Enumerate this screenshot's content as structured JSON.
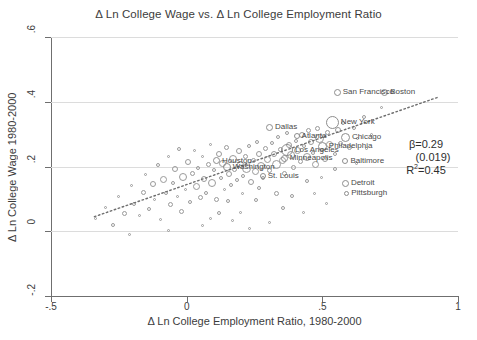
{
  "chart_data": {
    "type": "scatter",
    "title": "Δ Ln College Wage vs. Δ Ln College Employment Ratio",
    "xlabel": "Δ Ln College Employment Ratio, 1980-2000",
    "ylabel": "Δ Ln College Wage 1980-2000",
    "xlim": [
      -0.5,
      1.0
    ],
    "ylim": [
      -0.2,
      0.6
    ],
    "xticks": [
      "-.5",
      "0",
      ".5",
      "1"
    ],
    "xtick_values": [
      -0.5,
      0,
      0.5,
      1
    ],
    "yticks": [
      "-.2",
      "0",
      ".2",
      ".4",
      ".6"
    ],
    "ytick_values": [
      -0.2,
      0,
      0.2,
      0.4,
      0.6
    ],
    "grid": "horizontal",
    "legend": "none",
    "marker_style": "hollow-circle-weighted",
    "regression_line": {
      "style": "dotted",
      "x_start": -0.34,
      "y_start": 0.045,
      "x_end": 0.93,
      "y_end": 0.415
    },
    "annotations": {
      "beta": "β=0.29",
      "se": "(0.019)",
      "r2_prefix": "R",
      "r2_sup": "2",
      "r2_value": "=0.45"
    },
    "labeled_cities": [
      {
        "name": "San Francisco",
        "x": 0.555,
        "y": 0.43,
        "size": 7,
        "label_side": "right"
      },
      {
        "name": "Boston",
        "x": 0.73,
        "y": 0.43,
        "size": 7,
        "label_side": "right"
      },
      {
        "name": "New York",
        "x": 0.537,
        "y": 0.337,
        "size": 13,
        "label_side": "right"
      },
      {
        "name": "Dallas",
        "x": 0.305,
        "y": 0.322,
        "size": 7,
        "label_side": "right"
      },
      {
        "name": "Atlanta",
        "x": 0.405,
        "y": 0.293,
        "size": 6,
        "label_side": "right"
      },
      {
        "name": "Chicago",
        "x": 0.585,
        "y": 0.29,
        "size": 9,
        "label_side": "right"
      },
      {
        "name": "Philadelphia",
        "x": 0.5,
        "y": 0.262,
        "size": 9,
        "label_side": "right"
      },
      {
        "name": "Los Angeles",
        "x": 0.37,
        "y": 0.252,
        "size": 12,
        "label_side": "right"
      },
      {
        "name": "Minneapolis",
        "x": 0.36,
        "y": 0.226,
        "size": 7,
        "label_side": "right"
      },
      {
        "name": "Baltimore",
        "x": 0.585,
        "y": 0.217,
        "size": 6,
        "label_side": "right"
      },
      {
        "name": "Houston",
        "x": 0.11,
        "y": 0.217,
        "size": 7,
        "label_side": "right"
      },
      {
        "name": "Washington",
        "x": 0.148,
        "y": 0.198,
        "size": 8,
        "label_side": "right"
      },
      {
        "name": "St. Louis",
        "x": 0.28,
        "y": 0.17,
        "size": 6,
        "label_side": "right"
      },
      {
        "name": "Detroit",
        "x": 0.585,
        "y": 0.148,
        "size": 7,
        "label_side": "right"
      },
      {
        "name": "Pittsburgh",
        "x": 0.59,
        "y": 0.117,
        "size": 5,
        "label_side": "right"
      }
    ],
    "points": [
      {
        "x": -0.335,
        "y": 0.04,
        "size": 3
      },
      {
        "x": -0.3,
        "y": 0.072,
        "size": 3
      },
      {
        "x": -0.272,
        "y": 0.02,
        "size": 4
      },
      {
        "x": -0.25,
        "y": 0.108,
        "size": 3
      },
      {
        "x": -0.23,
        "y": 0.056,
        "size": 5
      },
      {
        "x": -0.205,
        "y": 0.14,
        "size": 3
      },
      {
        "x": -0.195,
        "y": 0.085,
        "size": 4
      },
      {
        "x": -0.175,
        "y": 0.048,
        "size": 3
      },
      {
        "x": -0.16,
        "y": 0.12,
        "size": 5
      },
      {
        "x": -0.15,
        "y": 0.175,
        "size": 3
      },
      {
        "x": -0.14,
        "y": 0.068,
        "size": 4
      },
      {
        "x": -0.125,
        "y": 0.145,
        "size": 6
      },
      {
        "x": -0.118,
        "y": 0.098,
        "size": 3
      },
      {
        "x": -0.105,
        "y": 0.205,
        "size": 4
      },
      {
        "x": -0.098,
        "y": 0.035,
        "size": 3
      },
      {
        "x": -0.085,
        "y": 0.16,
        "size": 7
      },
      {
        "x": -0.078,
        "y": 0.118,
        "size": 4
      },
      {
        "x": -0.068,
        "y": 0.23,
        "size": 3
      },
      {
        "x": -0.06,
        "y": 0.082,
        "size": 5
      },
      {
        "x": -0.05,
        "y": 0.15,
        "size": 4
      },
      {
        "x": -0.042,
        "y": 0.192,
        "size": 6
      },
      {
        "x": -0.035,
        "y": 0.108,
        "size": 3
      },
      {
        "x": -0.028,
        "y": 0.255,
        "size": 4
      },
      {
        "x": -0.02,
        "y": 0.062,
        "size": 5
      },
      {
        "x": -0.012,
        "y": 0.168,
        "size": 8
      },
      {
        "x": -0.005,
        "y": 0.128,
        "size": 3
      },
      {
        "x": 0.005,
        "y": 0.215,
        "size": 6
      },
      {
        "x": 0.012,
        "y": 0.09,
        "size": 4
      },
      {
        "x": 0.02,
        "y": 0.178,
        "size": 5
      },
      {
        "x": 0.028,
        "y": 0.248,
        "size": 3
      },
      {
        "x": 0.035,
        "y": 0.138,
        "size": 7
      },
      {
        "x": 0.042,
        "y": 0.196,
        "size": 4
      },
      {
        "x": 0.05,
        "y": 0.105,
        "size": 5
      },
      {
        "x": 0.058,
        "y": 0.232,
        "size": 3
      },
      {
        "x": 0.065,
        "y": 0.16,
        "size": 6
      },
      {
        "x": 0.072,
        "y": 0.118,
        "size": 4
      },
      {
        "x": 0.08,
        "y": 0.205,
        "size": 5
      },
      {
        "x": 0.088,
        "y": 0.268,
        "size": 3
      },
      {
        "x": 0.095,
        "y": 0.148,
        "size": 8
      },
      {
        "x": 0.102,
        "y": 0.188,
        "size": 4
      },
      {
        "x": 0.11,
        "y": 0.098,
        "size": 5
      },
      {
        "x": 0.118,
        "y": 0.238,
        "size": 6
      },
      {
        "x": 0.125,
        "y": 0.165,
        "size": 4
      },
      {
        "x": 0.132,
        "y": 0.21,
        "size": 7
      },
      {
        "x": 0.14,
        "y": 0.128,
        "size": 3
      },
      {
        "x": 0.148,
        "y": 0.258,
        "size": 5
      },
      {
        "x": 0.156,
        "y": 0.178,
        "size": 6
      },
      {
        "x": 0.163,
        "y": 0.142,
        "size": 4
      },
      {
        "x": 0.17,
        "y": 0.222,
        "size": 8
      },
      {
        "x": 0.178,
        "y": 0.19,
        "size": 5
      },
      {
        "x": 0.186,
        "y": 0.158,
        "size": 4
      },
      {
        "x": 0.193,
        "y": 0.248,
        "size": 6
      },
      {
        "x": 0.2,
        "y": 0.205,
        "size": 7
      },
      {
        "x": 0.208,
        "y": 0.172,
        "size": 4
      },
      {
        "x": 0.215,
        "y": 0.232,
        "size": 5
      },
      {
        "x": 0.222,
        "y": 0.195,
        "size": 9
      },
      {
        "x": 0.23,
        "y": 0.262,
        "size": 4
      },
      {
        "x": 0.238,
        "y": 0.152,
        "size": 6
      },
      {
        "x": 0.245,
        "y": 0.218,
        "size": 5
      },
      {
        "x": 0.252,
        "y": 0.185,
        "size": 7
      },
      {
        "x": 0.26,
        "y": 0.275,
        "size": 4
      },
      {
        "x": 0.268,
        "y": 0.24,
        "size": 6
      },
      {
        "x": 0.275,
        "y": 0.202,
        "size": 8
      },
      {
        "x": 0.282,
        "y": 0.165,
        "size": 4
      },
      {
        "x": 0.29,
        "y": 0.255,
        "size": 5
      },
      {
        "x": 0.298,
        "y": 0.222,
        "size": 7
      },
      {
        "x": 0.306,
        "y": 0.188,
        "size": 5
      },
      {
        "x": 0.314,
        "y": 0.272,
        "size": 4
      },
      {
        "x": 0.322,
        "y": 0.238,
        "size": 6
      },
      {
        "x": 0.33,
        "y": 0.205,
        "size": 9
      },
      {
        "x": 0.338,
        "y": 0.29,
        "size": 4
      },
      {
        "x": 0.346,
        "y": 0.252,
        "size": 5
      },
      {
        "x": 0.354,
        "y": 0.218,
        "size": 7
      },
      {
        "x": 0.362,
        "y": 0.178,
        "size": 5
      },
      {
        "x": 0.37,
        "y": 0.302,
        "size": 4
      },
      {
        "x": 0.378,
        "y": 0.265,
        "size": 6
      },
      {
        "x": 0.386,
        "y": 0.235,
        "size": 8
      },
      {
        "x": 0.394,
        "y": 0.198,
        "size": 5
      },
      {
        "x": 0.402,
        "y": 0.28,
        "size": 4
      },
      {
        "x": 0.41,
        "y": 0.248,
        "size": 7
      },
      {
        "x": 0.418,
        "y": 0.215,
        "size": 5
      },
      {
        "x": 0.426,
        "y": 0.298,
        "size": 6
      },
      {
        "x": 0.434,
        "y": 0.262,
        "size": 4
      },
      {
        "x": 0.442,
        "y": 0.228,
        "size": 8
      },
      {
        "x": 0.45,
        "y": 0.312,
        "size": 5
      },
      {
        "x": 0.458,
        "y": 0.275,
        "size": 6
      },
      {
        "x": 0.466,
        "y": 0.242,
        "size": 4
      },
      {
        "x": 0.474,
        "y": 0.205,
        "size": 7
      },
      {
        "x": 0.482,
        "y": 0.318,
        "size": 5
      },
      {
        "x": 0.49,
        "y": 0.285,
        "size": 9
      },
      {
        "x": 0.498,
        "y": 0.252,
        "size": 4
      },
      {
        "x": 0.508,
        "y": 0.222,
        "size": 6
      },
      {
        "x": 0.518,
        "y": 0.305,
        "size": 5
      },
      {
        "x": 0.528,
        "y": 0.268,
        "size": 7
      },
      {
        "x": 0.545,
        "y": 0.238,
        "size": 4
      },
      {
        "x": 0.556,
        "y": 0.312,
        "size": 6
      },
      {
        "x": 0.566,
        "y": 0.272,
        "size": 5
      },
      {
        "x": 0.576,
        "y": 0.335,
        "size": 4
      },
      {
        "x": 0.6,
        "y": 0.258,
        "size": 5
      },
      {
        "x": 0.615,
        "y": 0.318,
        "size": 4
      },
      {
        "x": 0.63,
        "y": 0.285,
        "size": 3
      },
      {
        "x": 0.652,
        "y": 0.352,
        "size": 4
      },
      {
        "x": 0.68,
        "y": 0.3,
        "size": 3
      },
      {
        "x": 0.718,
        "y": 0.382,
        "size": 3
      },
      {
        "x": -0.21,
        "y": -0.01,
        "size": 3
      },
      {
        "x": 0.06,
        "y": 0.018,
        "size": 3
      },
      {
        "x": 0.168,
        "y": 0.032,
        "size": 3
      },
      {
        "x": 0.23,
        "y": 0.008,
        "size": 3
      },
      {
        "x": 0.305,
        "y": 0.028,
        "size": 3
      },
      {
        "x": 0.118,
        "y": 0.055,
        "size": 4
      },
      {
        "x": 0.355,
        "y": 0.072,
        "size": 4
      },
      {
        "x": 0.43,
        "y": 0.058,
        "size": 3
      },
      {
        "x": 0.255,
        "y": 0.095,
        "size": 4
      },
      {
        "x": 0.47,
        "y": 0.118,
        "size": 3
      },
      {
        "x": 0.515,
        "y": 0.085,
        "size": 3
      },
      {
        "x": 0.198,
        "y": 0.058,
        "size": 3
      },
      {
        "x": 0.088,
        "y": 0.04,
        "size": 3
      },
      {
        "x": -0.068,
        "y": 0.002,
        "size": 3
      },
      {
        "x": 0.39,
        "y": 0.108,
        "size": 4
      },
      {
        "x": 0.152,
        "y": 0.092,
        "size": 4
      },
      {
        "x": 0.33,
        "y": 0.118,
        "size": 5
      },
      {
        "x": 0.265,
        "y": 0.135,
        "size": 4
      },
      {
        "x": 0.205,
        "y": 0.118,
        "size": 3
      },
      {
        "x": 0.445,
        "y": 0.155,
        "size": 4
      },
      {
        "x": 0.498,
        "y": 0.165,
        "size": 3
      },
      {
        "x": 0.545,
        "y": 0.192,
        "size": 4
      },
      {
        "x": 0.625,
        "y": 0.21,
        "size": 3
      },
      {
        "x": 0.662,
        "y": 0.255,
        "size": 3
      }
    ]
  }
}
